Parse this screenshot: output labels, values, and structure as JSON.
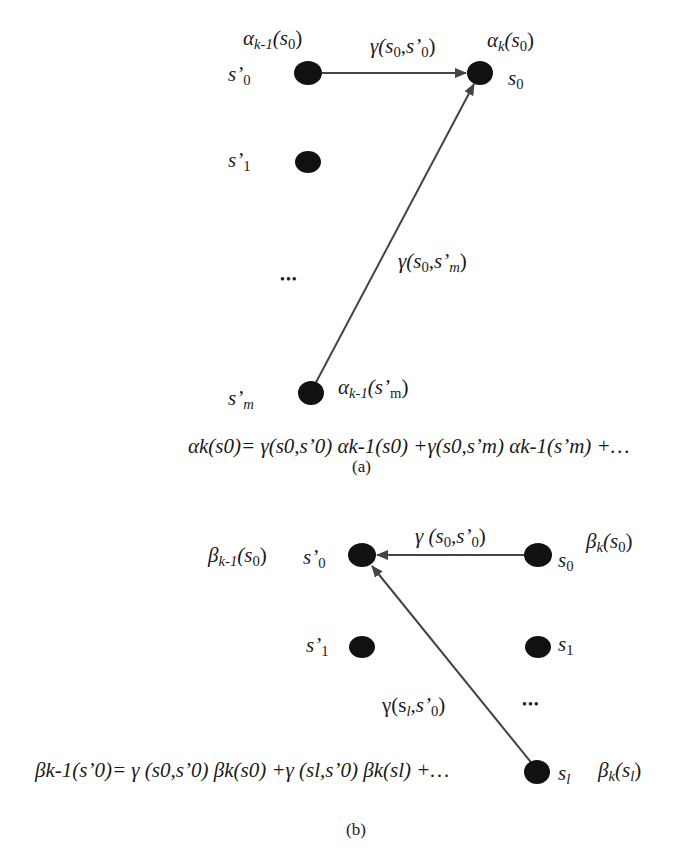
{
  "panel_a": {
    "caption": "(a)",
    "nodes": {
      "s_prime_0": {
        "label": "s’",
        "sub": "0"
      },
      "s_prime_1": {
        "label": "s’",
        "sub": "1"
      },
      "s_prime_m": {
        "label": "s’",
        "sub": "m"
      },
      "s_0": {
        "label": "s",
        "sub": "0"
      },
      "ellipsis": "•••"
    },
    "annotations": {
      "alpha_km1_s0": {
        "sym": "α",
        "sub": "k-1",
        "arg": "(s",
        "argsub": "0",
        "close": ")"
      },
      "alpha_k_s0": {
        "sym": "α",
        "sub": "k",
        "arg": "(s",
        "argsub": "0",
        "close": ")"
      },
      "alpha_km1_spm": {
        "sym": "α",
        "sub": "k-1",
        "arg": "(s’",
        "argsub": "m",
        "close": ")"
      },
      "gamma_s0_sp0": {
        "text": "γ(s",
        "s1": "0",
        "mid": ",s’",
        "s2": "0",
        "close": ")"
      },
      "gamma_s0_spm": {
        "text": "γ(s",
        "s1": "0",
        "mid": ",s’",
        "s2": "m",
        "close": ")"
      }
    },
    "formula": "αk(s0)= γ(s0,s’0) αk-1(s0) +γ(s0,s’m) αk-1(s’m) +…",
    "edges": [
      {
        "from": "s'0",
        "to": "s0",
        "label": "γ(s0,s'0)"
      },
      {
        "from": "s'm",
        "to": "s0",
        "label": "γ(s0,s'm)"
      }
    ]
  },
  "panel_b": {
    "caption": "(b)",
    "nodes": {
      "s_prime_0": {
        "label": "s’",
        "sub": "0"
      },
      "s_prime_1": {
        "label": "s’",
        "sub": "1"
      },
      "s_0": {
        "label": "s",
        "sub": "0"
      },
      "s_1": {
        "label": "s",
        "sub": "1"
      },
      "s_l": {
        "label": "s",
        "sub": "l"
      },
      "ellipsis": "•••"
    },
    "annotations": {
      "beta_km1_s0": {
        "sym": "β",
        "sub": "k-1",
        "arg": "(s",
        "argsub": "0",
        "close": ")"
      },
      "beta_k_s0": {
        "sym": "β",
        "sub": "k",
        "arg": "(s",
        "argsub": "0",
        "close": ")"
      },
      "beta_k_sl": {
        "sym": "β",
        "sub": "k",
        "arg": "(s",
        "argsub": "l",
        "close": ")"
      },
      "gamma_s0_sp0": {
        "text": "γ (s",
        "s1": "0",
        "mid": ",s’",
        "s2": "0",
        "close": ")"
      },
      "gamma_sl_sp0": {
        "text": "γ(s",
        "s1": "l",
        "mid": ",s’",
        "s2": "0",
        "close": ")"
      }
    },
    "formula": "βk-1(s’0)= γ (s0,s’0) βk(s0) +γ (sl,s’0) βk(sl) +…",
    "edges": [
      {
        "from": "s0",
        "to": "s'0",
        "label": "γ(s0,s'0)"
      },
      {
        "from": "sl",
        "to": "s'0",
        "label": "γ(sl,s'0)"
      }
    ]
  },
  "colors": {
    "node": "#111111",
    "edge": "#444444",
    "text": "#1a1a1a"
  }
}
